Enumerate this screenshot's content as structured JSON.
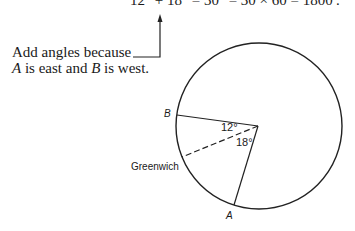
{
  "equation": "12° + 18° = 30° = 30 × 60 = 1800′.",
  "annotation": {
    "line1": "Add angles because",
    "line2_a": "A",
    "line2_mid": " is east and ",
    "line2_b": "B",
    "line2_end": " is west."
  },
  "diagram": {
    "point_b_label": "B",
    "point_a_label": "A",
    "meridian_label": "Greenwich",
    "angle_b_to_greenwich": "12°",
    "angle_greenwich_to_a": "18°",
    "angle_b_deg": 12,
    "angle_a_deg": 18
  }
}
